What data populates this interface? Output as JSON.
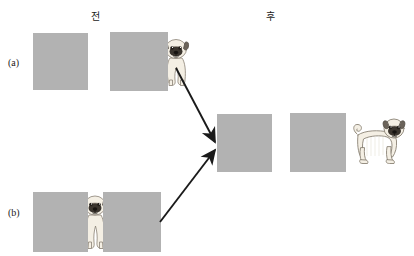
{
  "figure": {
    "column_headers": [
      {
        "label": "전",
        "meaning": "before",
        "x": 95,
        "y": 16
      },
      {
        "label": "후",
        "meaning": "after",
        "x": 270,
        "y": 16
      }
    ],
    "row_labels": [
      {
        "label": "(a)",
        "x": 8,
        "y": 57
      },
      {
        "label": "(b)",
        "x": 8,
        "y": 207
      }
    ],
    "occluders": [
      {
        "name": "occluder-a-left",
        "x": 33,
        "y": 33,
        "w": 55,
        "h": 57,
        "color": "#b2b2b2"
      },
      {
        "name": "occluder-a-right",
        "x": 110,
        "y": 32,
        "w": 58,
        "h": 59,
        "color": "#b2b2b2"
      },
      {
        "name": "occluder-b-left",
        "x": 33,
        "y": 192,
        "w": 55,
        "h": 60,
        "color": "#b2b2b2"
      },
      {
        "name": "occluder-b-right",
        "x": 103,
        "y": 192,
        "w": 58,
        "h": 60,
        "color": "#b2b2b2"
      },
      {
        "name": "occluder-result-center",
        "x": 217,
        "y": 114,
        "w": 55,
        "h": 58,
        "color": "#b2b2b2"
      },
      {
        "name": "occluder-result-right",
        "x": 290,
        "y": 113,
        "w": 56,
        "h": 59,
        "color": "#b2b2b2"
      }
    ],
    "dogs": [
      {
        "name": "pug-front-partial-a",
        "pose": "front-facing-partially-hidden",
        "x": 160,
        "y": 34,
        "w": 32,
        "h": 54
      },
      {
        "name": "pug-front-partial-b",
        "pose": "front-facing-partially-hidden",
        "x": 79,
        "y": 190,
        "w": 32,
        "h": 62
      },
      {
        "name": "pug-side-full",
        "pose": "side-profile-standing",
        "x": 348,
        "y": 112,
        "w": 58,
        "h": 60
      }
    ],
    "arrows": [
      {
        "name": "arrow-from-a",
        "x1": 176,
        "y1": 68,
        "x2": 216,
        "y2": 143
      },
      {
        "name": "arrow-from-b",
        "x1": 160,
        "y1": 222,
        "x2": 216,
        "y2": 149
      }
    ],
    "colors": {
      "occluder_gray": "#b2b2b2",
      "arrow_black": "#1a1a1a",
      "background": "#ffffff",
      "dog_body": "#f2ece0",
      "dog_outline": "#8a8275",
      "dog_face_dark": "#403a33"
    }
  }
}
